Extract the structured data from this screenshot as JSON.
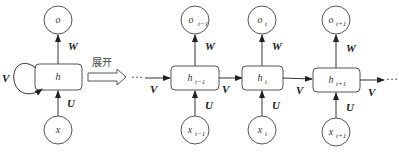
{
  "diagram": {
    "unfold_label": "展开",
    "ellipsis": "···",
    "weights": {
      "input": "U",
      "recurrent": "V",
      "output": "W"
    },
    "folded": {
      "output": "o",
      "hidden": "h",
      "input": "x"
    },
    "unfolded": [
      {
        "output": "o",
        "output_sub": "t−1",
        "hidden": "h",
        "hidden_sub": "t−1",
        "input": "x",
        "input_sub": "t−1"
      },
      {
        "output": "o",
        "output_sub": "t",
        "hidden": "h",
        "hidden_sub": "t",
        "input": "x",
        "input_sub": "t"
      },
      {
        "output": "o",
        "output_sub": "t+1",
        "hidden": "h",
        "hidden_sub": "t+1",
        "input": "x",
        "input_sub": "t+1"
      }
    ],
    "colors": {
      "stroke": "#555555",
      "text": "#333333",
      "background": "#ffffff"
    }
  }
}
